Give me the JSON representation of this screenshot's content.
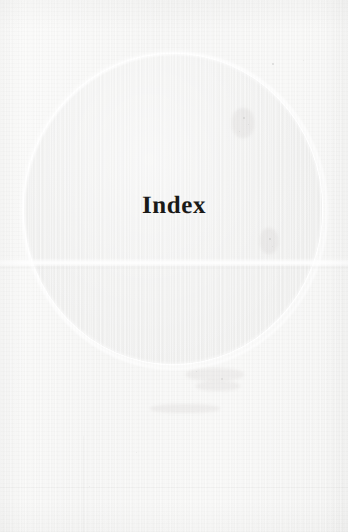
{
  "page": {
    "kind": "scanned-book-page",
    "section": "Index",
    "title": "Index",
    "width": 348,
    "height": 532,
    "body_text": "",
    "page_number": "",
    "header": "",
    "footer": ""
  },
  "colors": {
    "paper": "#f7f7f6",
    "paper_light": "#fbfbfa",
    "circle_fill": "#efefee",
    "circle_rim": "#ffffff",
    "title_text": "#1a1a18"
  },
  "graphic": {
    "shape": "circle",
    "name": "section-divider-circle",
    "center_x": 173,
    "center_y": 209,
    "diameter_x": 298,
    "diameter_y": 310,
    "fill": "#efefee",
    "rim": "#ffffff"
  },
  "artifacts": {
    "scan_seam_y": 262,
    "specks": [
      {
        "x": 272,
        "y": 63,
        "size": 2.0,
        "opacity": 0.22
      },
      {
        "x": 243,
        "y": 117,
        "size": 1.6,
        "opacity": 0.18
      },
      {
        "x": 248,
        "y": 124,
        "size": 1.2,
        "opacity": 0.15
      },
      {
        "x": 239,
        "y": 131,
        "size": 1.4,
        "opacity": 0.14
      },
      {
        "x": 269,
        "y": 238,
        "size": 1.6,
        "opacity": 0.17
      },
      {
        "x": 272,
        "y": 246,
        "size": 1.2,
        "opacity": 0.13
      },
      {
        "x": 221,
        "y": 378,
        "size": 1.5,
        "opacity": 0.14
      },
      {
        "x": 196,
        "y": 371,
        "size": 1.3,
        "opacity": 0.12
      },
      {
        "x": 303,
        "y": 60,
        "size": 1.4,
        "opacity": 0.13
      },
      {
        "x": 89,
        "y": 486,
        "size": 1.2,
        "opacity": 0.1
      },
      {
        "x": 136,
        "y": 452,
        "size": 1.1,
        "opacity": 0.1
      }
    ],
    "smudges": [
      {
        "x": 186,
        "y": 368,
        "w": 58,
        "h": 13
      },
      {
        "x": 196,
        "y": 381,
        "w": 44,
        "h": 10
      },
      {
        "x": 232,
        "y": 108,
        "w": 22,
        "h": 30
      },
      {
        "x": 260,
        "y": 228,
        "w": 18,
        "h": 26
      },
      {
        "x": 150,
        "y": 404,
        "w": 70,
        "h": 9
      }
    ]
  }
}
